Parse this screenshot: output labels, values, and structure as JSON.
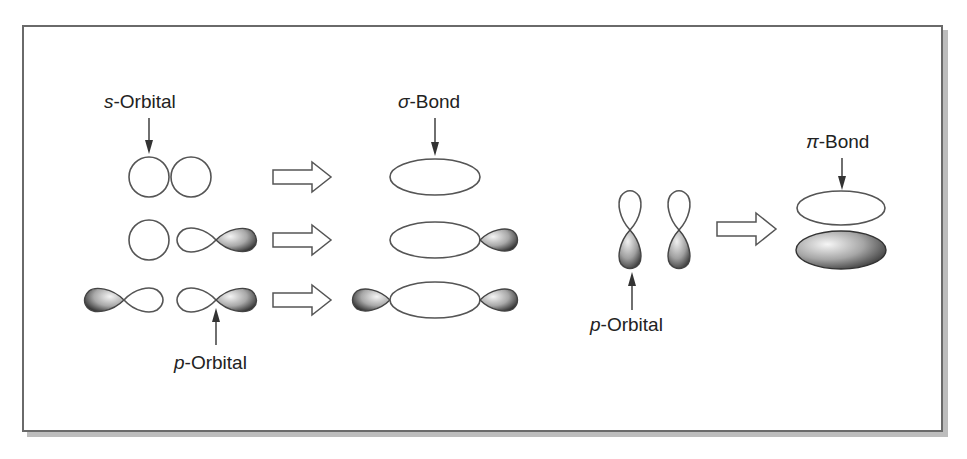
{
  "figure": {
    "labels": {
      "s_orbital": {
        "prefix": "s",
        "suffix": "-Orbital"
      },
      "sigma_bond": {
        "prefix": "σ",
        "suffix": "-Bond"
      },
      "p_orbital_left": {
        "prefix": "p",
        "suffix": "-Orbital"
      },
      "p_orbital_right": {
        "prefix": "p",
        "suffix": "-Orbital"
      },
      "pi_bond": {
        "prefix": "π",
        "suffix": "-Bond"
      }
    },
    "rows": [
      {
        "reactants": "s + s",
        "product": "σ-bond (s-s)"
      },
      {
        "reactants": "s + p",
        "product": "σ-bond (s-p)"
      },
      {
        "reactants": "p + p",
        "product": "σ-bond (p-p)"
      },
      {
        "reactants": "p + p (side by side)",
        "product": "π-bond"
      }
    ],
    "colors": {
      "stroke": "#555555",
      "lobe_dark": "#3a3a3a",
      "lobe_light": "#f2f2f2",
      "frame_border": "#6a6a6a",
      "shadow": "#bdbdbd"
    }
  }
}
